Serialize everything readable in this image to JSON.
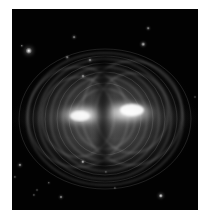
{
  "image": {
    "subject": "astronomical-nebula",
    "description": "Greyscale astronomical image showing a bipolar glowing nebula with concentric arc-like ripples, two bright horizontal lobes split by a dark vertical lane, surrounded by scattered point stars on a black background",
    "colors": {
      "background": "#ffffff",
      "sky": "#020202",
      "glow": "#d8d8d8",
      "core": "#ffffff"
    },
    "lobes": [
      {
        "name": "left-lobe",
        "cx": 70,
        "cy": 106
      },
      {
        "name": "right-lobe",
        "cx": 115,
        "cy": 104
      }
    ],
    "stars": [
      {
        "x": 17,
        "y": 42,
        "r": 3.2,
        "b": 1.0
      },
      {
        "x": 10,
        "y": 37,
        "r": 1.2,
        "b": 0.6
      },
      {
        "x": 62,
        "y": 28,
        "r": 1.4,
        "b": 0.6
      },
      {
        "x": 55,
        "y": 48,
        "r": 1.3,
        "b": 0.55
      },
      {
        "x": 78,
        "y": 51,
        "r": 1.5,
        "b": 0.6
      },
      {
        "x": 71,
        "y": 67,
        "r": 1.5,
        "b": 0.65
      },
      {
        "x": 136,
        "y": 19,
        "r": 1.3,
        "b": 0.6
      },
      {
        "x": 131,
        "y": 35,
        "r": 1.8,
        "b": 0.75
      },
      {
        "x": 8,
        "y": 156,
        "r": 1.6,
        "b": 0.75
      },
      {
        "x": 3,
        "y": 168,
        "r": 1.1,
        "b": 0.5
      },
      {
        "x": 71,
        "y": 153,
        "r": 1.7,
        "b": 0.8
      },
      {
        "x": 37,
        "y": 174,
        "r": 1.2,
        "b": 0.5
      },
      {
        "x": 25,
        "y": 181,
        "r": 1.0,
        "b": 0.45
      },
      {
        "x": 22,
        "y": 186,
        "r": 1.1,
        "b": 0.5
      },
      {
        "x": 49,
        "y": 188,
        "r": 1.5,
        "b": 0.65
      },
      {
        "x": 94,
        "y": 163,
        "r": 1.1,
        "b": 0.45
      },
      {
        "x": 103,
        "y": 179,
        "r": 1.1,
        "b": 0.45
      },
      {
        "x": 149,
        "y": 187,
        "r": 2.2,
        "b": 0.95
      },
      {
        "x": 183,
        "y": 88,
        "r": 1.0,
        "b": 0.4
      }
    ]
  }
}
